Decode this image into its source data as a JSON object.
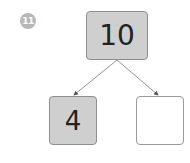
{
  "question_number": "11",
  "colors": {
    "filled_box": "#cfcfcf",
    "badge": "#b8b8b8",
    "line": "#666666"
  },
  "diagram": {
    "type": "number-bond",
    "whole": "10",
    "parts": [
      "4",
      ""
    ]
  }
}
